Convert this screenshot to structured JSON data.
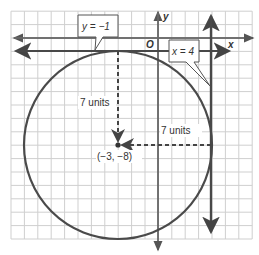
{
  "figure": {
    "type": "coordinate-plane",
    "grid": {
      "cols": 18,
      "rows": 17
    },
    "axes": {
      "x_label": "x",
      "y_label": "y",
      "origin_label": "O"
    },
    "circle": {
      "center": [
        -3,
        -8
      ],
      "radius": 7
    },
    "lines": [
      {
        "equation": "y = −1",
        "label": "y = −1"
      },
      {
        "equation": "x = 4",
        "label": "x = 4"
      }
    ],
    "annotations": {
      "vertical_radius": "7 units",
      "horizontal_radius": "7 units",
      "center_label": "(−3, −8)"
    },
    "colors": {
      "grid": "#c8c8c8",
      "axis": "#555555",
      "circle": "#4a4a4a",
      "line": "#505050"
    }
  }
}
